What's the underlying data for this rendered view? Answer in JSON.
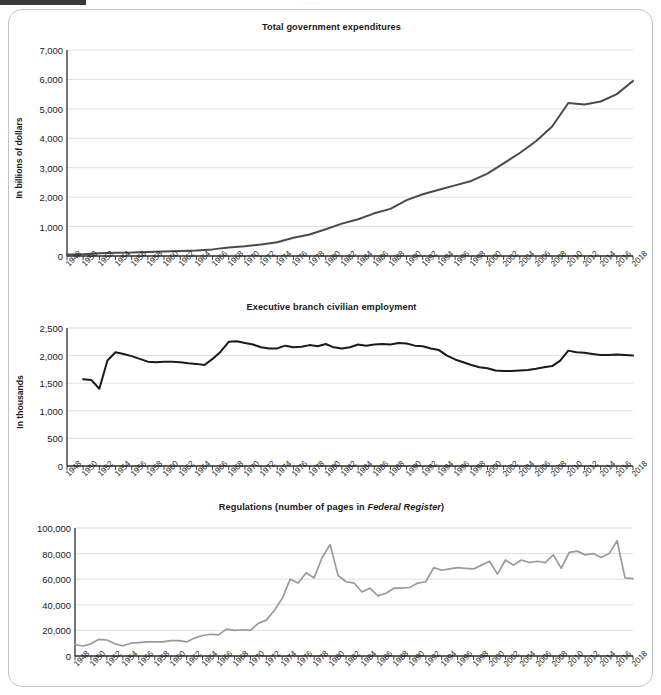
{
  "page": {
    "cropped_header_text": "· · ·   ·   ·           ·",
    "background": "#ffffff",
    "panel_border_color": "#c2c2c6"
  },
  "charts": [
    {
      "title": "Total government expenditures",
      "title_italic_part": "",
      "ylabel": "In billions of dollars",
      "line_color": "#4a4a4a"
    },
    {
      "title": "Executive branch civilian employment",
      "title_italic_part": "",
      "ylabel": "In thousands",
      "line_color": "#1a1a1a"
    },
    {
      "title_prefix": "Regulations (number of pages in ",
      "title_italic": "Federal Register",
      "title_suffix": ")",
      "ylabel": "",
      "line_color": "#9a9a9a"
    }
  ],
  "chart_data": [
    {
      "type": "line",
      "title": "Total government expenditures",
      "xlabel": "",
      "ylabel": "In billions of dollars",
      "ylim": [
        0,
        7000
      ],
      "yticks": [
        "0",
        "1,000",
        "2,000",
        "3,000",
        "4,000",
        "5,000",
        "6,000",
        "7,000"
      ],
      "ytick_values": [
        0,
        1000,
        2000,
        3000,
        4000,
        5000,
        6000,
        7000
      ],
      "xlim": [
        1948,
        2018
      ],
      "xticks": [
        "1948",
        "1950",
        "1952",
        "1954",
        "1956",
        "1958",
        "1960",
        "1962",
        "1964",
        "1966",
        "1968",
        "1970",
        "1972",
        "1974",
        "1976",
        "1978",
        "1980",
        "1982",
        "1984",
        "1986",
        "1988",
        "1990",
        "1992",
        "1994",
        "1996",
        "1998",
        "2000",
        "2002",
        "2004",
        "2006",
        "2008",
        "2010",
        "2012",
        "2014",
        "2016",
        "2018"
      ],
      "grid": true,
      "legend": "none",
      "x": [
        1948,
        1950,
        1952,
        1954,
        1956,
        1958,
        1960,
        1962,
        1964,
        1966,
        1968,
        1970,
        1972,
        1974,
        1976,
        1978,
        1980,
        1982,
        1984,
        1986,
        1988,
        1990,
        1992,
        1994,
        1996,
        1998,
        2000,
        2002,
        2004,
        2006,
        2008,
        2010,
        2012,
        2014,
        2016,
        2018
      ],
      "values": [
        50,
        60,
        95,
        110,
        115,
        135,
        150,
        170,
        190,
        225,
        285,
        330,
        390,
        470,
        620,
        730,
        910,
        1100,
        1250,
        1450,
        1600,
        1900,
        2100,
        2250,
        2400,
        2550,
        2800,
        3150,
        3500,
        3900,
        4400,
        5200,
        5150,
        5250,
        5500,
        5950
      ]
    },
    {
      "type": "line",
      "title": "Executive branch civilian employment",
      "xlabel": "",
      "ylabel": "In thousands",
      "ylim": [
        0,
        2500
      ],
      "yticks": [
        "0",
        "500",
        "1,000",
        "1,500",
        "2,000",
        "2,500"
      ],
      "ytick_values": [
        0,
        500,
        1000,
        1500,
        2000,
        2500
      ],
      "xlim": [
        1948,
        2018
      ],
      "xticks": [
        "1948",
        "1950",
        "1952",
        "1954",
        "1956",
        "1958",
        "1960",
        "1962",
        "1964",
        "1966",
        "1968",
        "1970",
        "1972",
        "1974",
        "1976",
        "1978",
        "1980",
        "1982",
        "1984",
        "1986",
        "1988",
        "1990",
        "1992",
        "1994",
        "1996",
        "1998",
        "2000",
        "2002",
        "2004",
        "2006",
        "2008",
        "2010",
        "2012",
        "2014",
        "2016",
        "2018"
      ],
      "grid": true,
      "legend": "none",
      "x": [
        1950,
        1951,
        1952,
        1953,
        1954,
        1955,
        1956,
        1957,
        1958,
        1959,
        1960,
        1961,
        1962,
        1963,
        1964,
        1965,
        1966,
        1967,
        1968,
        1969,
        1970,
        1971,
        1972,
        1973,
        1974,
        1975,
        1976,
        1977,
        1978,
        1979,
        1980,
        1981,
        1982,
        1983,
        1984,
        1985,
        1986,
        1987,
        1988,
        1989,
        1990,
        1991,
        1992,
        1993,
        1994,
        1995,
        1996,
        1997,
        1998,
        1999,
        2000,
        2001,
        2002,
        2003,
        2004,
        2005,
        2006,
        2007,
        2008,
        2009,
        2010,
        2011,
        2012,
        2013,
        2014,
        2015,
        2016,
        2017,
        2018
      ],
      "values": [
        1570,
        1560,
        1400,
        1910,
        2060,
        2030,
        1990,
        1940,
        1890,
        1880,
        1890,
        1890,
        1880,
        1860,
        1850,
        1830,
        1940,
        2070,
        2250,
        2260,
        2230,
        2200,
        2150,
        2130,
        2130,
        2180,
        2150,
        2160,
        2190,
        2170,
        2210,
        2150,
        2130,
        2150,
        2200,
        2180,
        2200,
        2210,
        2200,
        2230,
        2220,
        2180,
        2170,
        2130,
        2100,
        2000,
        1930,
        1880,
        1830,
        1790,
        1770,
        1730,
        1720,
        1720,
        1730,
        1740,
        1760,
        1790,
        1810,
        1910,
        2090,
        2060,
        2050,
        2030,
        2010,
        2010,
        2020,
        2010,
        2000
      ]
    },
    {
      "type": "line",
      "title": "Regulations (number of pages in Federal Register)",
      "xlabel": "",
      "ylabel": "",
      "ylim": [
        0,
        100000
      ],
      "yticks": [
        "0",
        "20,000",
        "40,000",
        "60,000",
        "80,000",
        "100,000"
      ],
      "ytick_values": [
        0,
        20000,
        40000,
        60000,
        80000,
        100000
      ],
      "xlim": [
        1948,
        2018
      ],
      "xticks": [
        "1948",
        "1950",
        "1952",
        "1954",
        "1956",
        "1958",
        "1960",
        "1962",
        "1964",
        "1966",
        "1968",
        "1970",
        "1972",
        "1974",
        "1976",
        "1978",
        "1980",
        "1982",
        "1984",
        "1986",
        "1988",
        "1990",
        "1992",
        "1994",
        "1996",
        "1998",
        "2000",
        "2002",
        "2004",
        "2006",
        "2008",
        "2010",
        "2012",
        "2014",
        "2016",
        "2018"
      ],
      "grid": true,
      "legend": "none",
      "x": [
        1948,
        1949,
        1950,
        1951,
        1952,
        1953,
        1954,
        1955,
        1956,
        1957,
        1958,
        1959,
        1960,
        1961,
        1962,
        1963,
        1964,
        1965,
        1966,
        1967,
        1968,
        1969,
        1970,
        1971,
        1972,
        1973,
        1974,
        1975,
        1976,
        1977,
        1978,
        1979,
        1980,
        1981,
        1982,
        1983,
        1984,
        1985,
        1986,
        1987,
        1988,
        1989,
        1990,
        1991,
        1992,
        1993,
        1994,
        1995,
        1996,
        1997,
        1998,
        1999,
        2000,
        2001,
        2002,
        2003,
        2004,
        2005,
        2006,
        2007,
        2008,
        2009,
        2010,
        2011,
        2012,
        2013,
        2014,
        2015,
        2016,
        2017,
        2018
      ],
      "values": [
        9000,
        7800,
        9500,
        13000,
        12500,
        9500,
        8000,
        10000,
        10500,
        11000,
        11000,
        11000,
        12000,
        12000,
        11000,
        14000,
        16000,
        17000,
        16500,
        21000,
        20000,
        20500,
        20000,
        25500,
        28000,
        35500,
        45000,
        60000,
        57000,
        65000,
        61000,
        77000,
        87000,
        63000,
        58000,
        57000,
        50000,
        53000,
        47000,
        49000,
        53000,
        53000,
        53500,
        57000,
        58000,
        69000,
        67000,
        68000,
        69000,
        68500,
        68000,
        71000,
        74000,
        64000,
        75000,
        71000,
        75000,
        73000,
        74000,
        73000,
        79000,
        68500,
        81000,
        82000,
        79000,
        80000,
        77000,
        80000,
        90000,
        61000,
        60500
      ]
    }
  ]
}
